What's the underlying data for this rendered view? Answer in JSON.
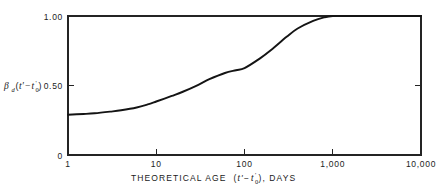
{
  "chart_data": {
    "type": "line",
    "title": "",
    "xlabel": "THEORETICAL AGE (t'-t₀'), DAYS",
    "ylabel": "βd(t'-t₀')",
    "xscale": "log",
    "yscale": "linear",
    "xlim": [
      1,
      10000
    ],
    "ylim": [
      0,
      1.0
    ],
    "grid": false,
    "legend": null,
    "xticks": [
      1,
      10,
      100,
      1000,
      10000
    ],
    "xticklabels": [
      "1",
      "10",
      "100",
      "1,000",
      "10,000"
    ],
    "yticks": [
      0,
      0.5,
      1.0
    ],
    "yticklabels": [
      "0",
      "0.50",
      "1.00"
    ],
    "series": [
      {
        "name": "beta_d",
        "x": [
          1,
          1.5,
          2,
          3,
          4,
          6,
          8,
          10,
          15,
          20,
          30,
          40,
          60,
          80,
          100,
          150,
          200,
          300,
          400,
          600,
          800,
          1000,
          1500,
          2000,
          3000,
          5000,
          10000
        ],
        "values": [
          0.29,
          0.295,
          0.3,
          0.312,
          0.322,
          0.342,
          0.364,
          0.385,
          0.425,
          0.455,
          0.505,
          0.545,
          0.59,
          0.61,
          0.625,
          0.695,
          0.755,
          0.85,
          0.91,
          0.965,
          0.99,
          1.0,
          1.0,
          1.0,
          1.0,
          1.0,
          1.0
        ]
      }
    ]
  },
  "axis_labels": {
    "y_beta": "β",
    "y_subscript": "d",
    "y_open_paren": "(",
    "y_t_prime": "t'",
    "y_minus": "−",
    "y_t_sub": "t",
    "y_t_sub_index": "0",
    "y_t_sub_prime": "'",
    "y_close_paren": ")",
    "y_top_value": "1.00",
    "y_mid_value": "0.50",
    "y_zero_value": "0",
    "x_title_lead": "THEORETICAL AGE",
    "x_title_open": "(",
    "x_title_t_prime": "t'",
    "x_title_minus": "−",
    "x_title_t": "t",
    "x_title_t_index": "0",
    "x_title_t_prime2": "'",
    "x_title_close": "), DAYS",
    "x_tick_1": "1",
    "x_tick_10": "10",
    "x_tick_100": "100",
    "x_tick_1000": "1,000",
    "x_tick_10000": "10,000"
  },
  "colors": {
    "curve": "#141414",
    "axis": "#242424",
    "background": "#ffffff",
    "text": "#1a1a1a"
  }
}
